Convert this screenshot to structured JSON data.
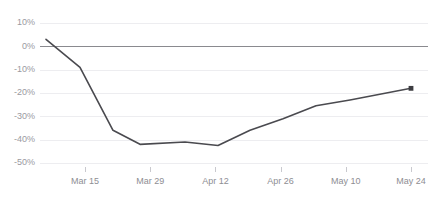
{
  "chart_data": {
    "type": "line",
    "title": "",
    "subtitle": "",
    "xlabel": "",
    "ylabel": "",
    "ylim": [
      -50,
      10
    ],
    "y_ticks": [
      10,
      0,
      -10,
      -20,
      -30,
      -40,
      -50
    ],
    "y_tick_labels": [
      "10%",
      "0%",
      "-10%",
      "-20%",
      "-30%",
      "-40%",
      "-50%"
    ],
    "x_ticks": [
      "Mar 15",
      "Mar 29",
      "Apr 12",
      "Apr 26",
      "May 10",
      "May 24"
    ],
    "x_tick_labels": [
      "Mar 15",
      "Mar 29",
      "Apr 12",
      "Apr 26",
      "May 10",
      "May 24"
    ],
    "grid": true,
    "grid_axis": "y",
    "legend": "none",
    "zero_line": true,
    "series": [
      {
        "name": "Percent change",
        "color": "#4a4a4f",
        "end_marker": true,
        "x": [
          "Mar 8",
          "Mar 13",
          "Mar 20",
          "Mar 26",
          "Apr 5",
          "Apr 12",
          "Apr 19",
          "Apr 26",
          "May 3",
          "May 10",
          "May 24"
        ],
        "values": [
          3,
          -9,
          -36,
          -42,
          -41,
          -42.5,
          -36,
          -31,
          -25.5,
          -23,
          -18
        ]
      }
    ],
    "colors": {
      "line": "#4a4a4f",
      "gridline": "#ededf0",
      "zero_line": "#8a8a8f",
      "tick_label": "#8e8e93",
      "y_tick_label": "#9a9a9f",
      "background": "#ffffff",
      "end_marker": "#3c3c41"
    },
    "annotations": []
  },
  "chart": {
    "title_clip_text": "",
    "final_value_label": "-18%",
    "start_value_label": "3%",
    "min_value_label": "-42.5%"
  }
}
